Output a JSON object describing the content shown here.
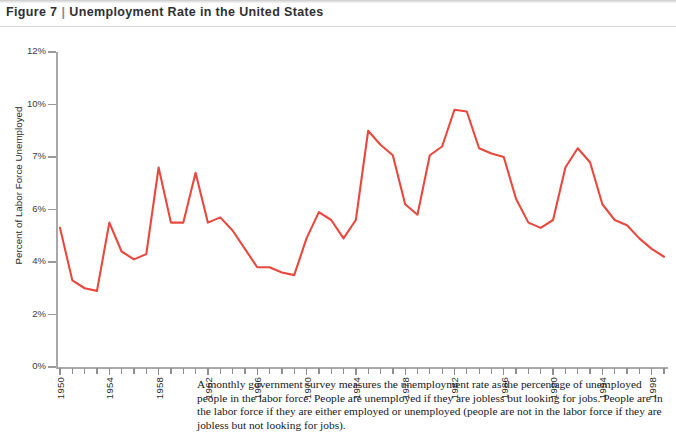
{
  "figure": {
    "number_label": "Figure 7",
    "separator": "|",
    "title": "Unemployment Rate in the United States"
  },
  "caption": "A monthly government survey measures the unemployment rate as the percentage of unemployed people in the labor force. People are unemployed if they are jobless but looking for jobs. People are in the labor force if they are either employed or unemployed (people are not in the labor force if they are jobless but not looking for jobs).",
  "colors": {
    "series_line": "#e8493f",
    "axis": "#a8a8a8",
    "tick": "#8f8f8f",
    "text": "#2d2d2d",
    "title_text": "#2f3033",
    "background": "#ffffff"
  },
  "chart_data": {
    "type": "line",
    "title": "Unemployment Rate in the United States",
    "xlabel": "",
    "ylabel": "Percent of Labor Force Unemployed",
    "grid": false,
    "legend": "none",
    "y_tick_labels": [
      "12%",
      "10%",
      "7%",
      "6%",
      "4%",
      "2%",
      "0%"
    ],
    "y_tick_values": [
      12,
      10,
      7,
      6,
      4,
      2,
      0
    ],
    "y_axis_note": "tick labels are evenly spaced (non-linear between 10% and 6%)",
    "x_tick_labels": [
      "1950",
      "1954",
      "1958",
      "1962",
      "1966",
      "1970",
      "1974",
      "1978",
      "1982",
      "1986",
      "1990",
      "1994",
      "1998"
    ],
    "x_minor_tick_step": 1,
    "xlim": [
      1950,
      1999
    ],
    "x": [
      1950,
      1951,
      1952,
      1953,
      1954,
      1955,
      1956,
      1957,
      1958,
      1959,
      1960,
      1961,
      1962,
      1963,
      1964,
      1965,
      1966,
      1967,
      1968,
      1969,
      1970,
      1971,
      1972,
      1973,
      1974,
      1975,
      1976,
      1977,
      1978,
      1979,
      1980,
      1981,
      1982,
      1983,
      1984,
      1985,
      1986,
      1987,
      1988,
      1989,
      1990,
      1991,
      1992,
      1993,
      1994,
      1995,
      1996,
      1997,
      1998,
      1999
    ],
    "values": [
      5.3,
      3.3,
      3.0,
      2.9,
      5.5,
      4.4,
      4.1,
      4.3,
      6.8,
      5.5,
      5.5,
      6.7,
      5.5,
      5.7,
      5.2,
      4.5,
      3.8,
      3.8,
      3.6,
      3.5,
      4.9,
      5.9,
      5.6,
      4.9,
      5.6,
      8.5,
      7.7,
      7.1,
      6.1,
      5.8,
      7.1,
      7.6,
      9.7,
      9.6,
      7.5,
      7.2,
      7.0,
      6.2,
      5.5,
      5.3,
      5.6,
      6.8,
      7.5,
      6.9,
      6.1,
      5.6,
      5.4,
      4.9,
      4.5,
      4.2
    ],
    "series": [
      {
        "name": "Unemployment rate",
        "unit": "percent",
        "values": [
          5.3,
          3.3,
          3.0,
          2.9,
          5.5,
          4.4,
          4.1,
          4.3,
          6.8,
          5.5,
          5.5,
          6.7,
          5.5,
          5.7,
          5.2,
          4.5,
          3.8,
          3.8,
          3.6,
          3.5,
          4.9,
          5.9,
          5.6,
          4.9,
          5.6,
          8.5,
          7.7,
          7.1,
          6.1,
          5.8,
          7.1,
          7.6,
          9.7,
          9.6,
          7.5,
          7.2,
          7.0,
          6.2,
          5.5,
          5.3,
          5.6,
          6.8,
          7.5,
          6.9,
          6.1,
          5.6,
          5.4,
          4.9,
          4.5,
          4.2
        ]
      }
    ],
    "annotations": {
      "peak_year": 1982,
      "peak_value": 9.7,
      "min_year": 1953,
      "min_value": 2.9
    }
  }
}
